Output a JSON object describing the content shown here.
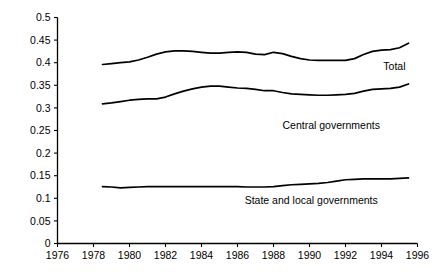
{
  "chart_data": {
    "type": "line",
    "title": "",
    "subtitle": "",
    "xlabel": "",
    "ylabel": "",
    "xlim": [
      1976,
      1996
    ],
    "ylim": [
      0,
      0.5
    ],
    "grid": false,
    "legend_position": "inline-right-of-series",
    "x_ticks": [
      "1976",
      "1978",
      "1980",
      "1982",
      "1984",
      "1986",
      "1988",
      "1990",
      "1992",
      "1994",
      "1996"
    ],
    "x_tick_values": [
      1976,
      1978,
      1980,
      1982,
      1984,
      1986,
      1988,
      1990,
      1992,
      1994,
      1996
    ],
    "y_ticks": [
      "0",
      "0.05",
      "0.1",
      "0.15",
      "0.2",
      "0.25",
      "0.3",
      "0.35",
      "0.4",
      "0.45",
      "0.5"
    ],
    "y_tick_values": [
      0,
      0.05,
      0.1,
      0.15,
      0.2,
      0.25,
      0.3,
      0.35,
      0.4,
      0.45,
      0.5
    ],
    "line_color": "#000000",
    "x": [
      1978.5,
      1979,
      1979.5,
      1980,
      1980.5,
      1981,
      1981.5,
      1982,
      1982.5,
      1983,
      1983.5,
      1984,
      1984.5,
      1985,
      1985.5,
      1986,
      1986.5,
      1987,
      1987.5,
      1988,
      1988.5,
      1989,
      1989.5,
      1990,
      1990.5,
      1991,
      1991.5,
      1992,
      1992.5,
      1993,
      1993.5,
      1994,
      1994.5,
      1995,
      1995.5
    ],
    "series": [
      {
        "name": "Total",
        "label": "Total",
        "label_x": 1994.1,
        "label_y": 0.383,
        "values": [
          0.396,
          0.398,
          0.4,
          0.402,
          0.406,
          0.412,
          0.419,
          0.424,
          0.426,
          0.426,
          0.425,
          0.423,
          0.421,
          0.421,
          0.423,
          0.424,
          0.423,
          0.419,
          0.418,
          0.423,
          0.42,
          0.414,
          0.409,
          0.406,
          0.405,
          0.405,
          0.405,
          0.405,
          0.409,
          0.418,
          0.425,
          0.428,
          0.429,
          0.433,
          0.443
        ]
      },
      {
        "name": "Central governments",
        "label": "Central governments",
        "label_x": 1988.5,
        "label_y": 0.253,
        "values": [
          0.309,
          0.311,
          0.314,
          0.317,
          0.319,
          0.32,
          0.32,
          0.324,
          0.331,
          0.337,
          0.342,
          0.346,
          0.348,
          0.348,
          0.346,
          0.344,
          0.343,
          0.341,
          0.338,
          0.338,
          0.334,
          0.331,
          0.33,
          0.329,
          0.328,
          0.328,
          0.329,
          0.33,
          0.332,
          0.337,
          0.341,
          0.342,
          0.343,
          0.346,
          0.353
        ]
      },
      {
        "name": "State and local governments",
        "label": "State and local governments",
        "label_x": 1986.4,
        "label_y": 0.088,
        "values": [
          0.126,
          0.125,
          0.123,
          0.124,
          0.125,
          0.126,
          0.126,
          0.126,
          0.126,
          0.126,
          0.126,
          0.126,
          0.126,
          0.126,
          0.126,
          0.126,
          0.125,
          0.125,
          0.125,
          0.126,
          0.128,
          0.13,
          0.131,
          0.132,
          0.133,
          0.135,
          0.138,
          0.141,
          0.142,
          0.143,
          0.143,
          0.143,
          0.143,
          0.144,
          0.145
        ]
      }
    ]
  }
}
